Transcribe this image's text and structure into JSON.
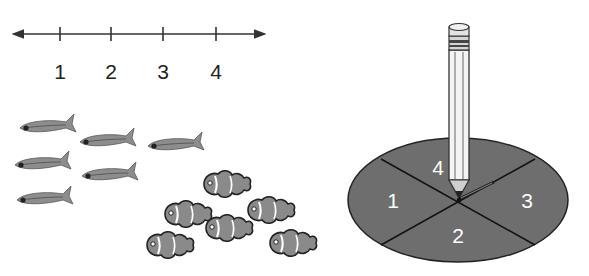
{
  "number_line": {
    "labels": [
      "1",
      "2",
      "3",
      "4"
    ],
    "has_arrows_both_ends": true
  },
  "fish_groups": {
    "neon_tetras": {
      "count": 6,
      "color": "#8c8c8c"
    },
    "clownfish": {
      "count": 6,
      "color": "#8a8a8a"
    }
  },
  "spinner": {
    "sections": [
      "1",
      "2",
      "3",
      "4"
    ],
    "section_color": "#6e6e6e",
    "pointer": "paper clip held by pencil"
  }
}
